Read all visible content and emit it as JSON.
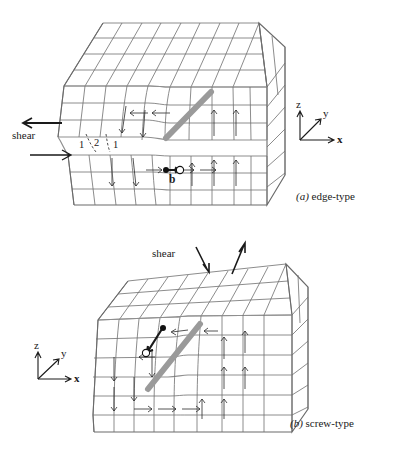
{
  "figure": {
    "background_color": "#ffffff",
    "lattice_color": "#6f6f6f",
    "dislocation_color": "#9a9a9a",
    "marker_color": "#111111"
  },
  "panel_a": {
    "caption_tag": "(a)",
    "caption_text": "edge-type",
    "shear_label": "shear",
    "burgers_label": "b",
    "plane_numbers": [
      "1",
      "2",
      "1"
    ],
    "axes": {
      "z": "z",
      "y": "y",
      "x": "x"
    },
    "shear_arrows": [
      {
        "name": "shear-arrow-top",
        "direction": "left"
      },
      {
        "name": "shear-arrow-bottom",
        "direction": "right"
      }
    ],
    "markers": [
      {
        "name": "burgers-start-marker",
        "style": "filled"
      },
      {
        "name": "burgers-end-marker",
        "style": "open"
      }
    ]
  },
  "panel_b": {
    "caption_tag": "(b)",
    "caption_text": "screw-type",
    "shear_label": "shear",
    "axes": {
      "z": "z",
      "y": "y",
      "x": "x"
    },
    "shear_arrows": [
      {
        "name": "shear-arrow-down",
        "direction": "down-left"
      },
      {
        "name": "shear-arrow-up",
        "direction": "up-right"
      }
    ],
    "markers": [
      {
        "name": "burgers-start-marker",
        "style": "filled"
      },
      {
        "name": "burgers-end-marker",
        "style": "open"
      }
    ]
  }
}
